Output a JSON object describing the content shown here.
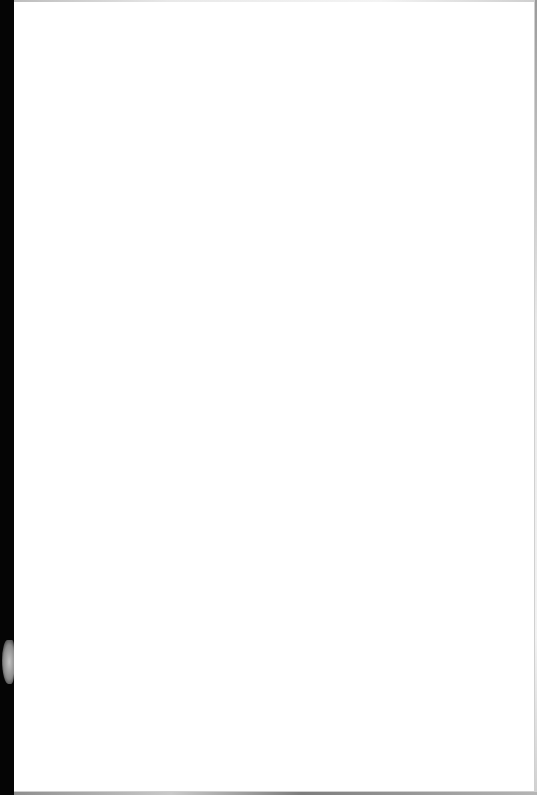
{
  "document": {
    "content": "",
    "description": "blank white page",
    "colors": {
      "page": "#ffffff",
      "left_strip": "#000000",
      "smudge": "#a0a0a0"
    }
  }
}
